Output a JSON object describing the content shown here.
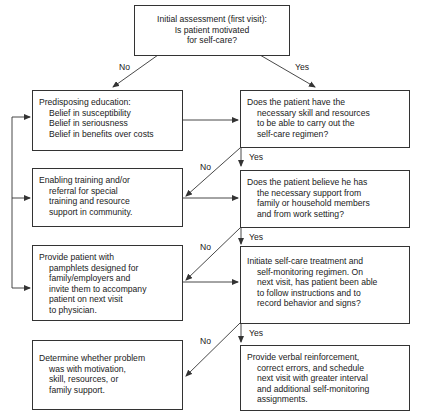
{
  "nodes": {
    "start": {
      "lines": [
        "Initial assessment (first visit):",
        "Is patient motivated",
        "for self-care?"
      ]
    },
    "predisposing": {
      "lines": [
        "Predisposing education:",
        "Belief in susceptibility",
        "Belief in seriousness",
        "Belief in benefits over costs"
      ]
    },
    "enabling": {
      "lines": [
        "Enabling training and/or",
        "referral for special",
        "training and resource",
        "support in community."
      ]
    },
    "pamphlets": {
      "lines": [
        "Provide patient with",
        "pamphlets designed for",
        "family/employers and",
        "invite them to accompany",
        "patient on next visit",
        "to physician."
      ]
    },
    "determine": {
      "lines": [
        "Determine whether problem",
        "was with motivation,",
        "skill, resources, or",
        "family support."
      ]
    },
    "skill_question": {
      "lines": [
        "Does the patient have the",
        "necessary skill and resources",
        "to be able to carry out the",
        "self-care regimen?"
      ]
    },
    "support_question": {
      "lines": [
        "Does the patient believe he has",
        "the necessary support from",
        "family or household members",
        "and from work setting?"
      ]
    },
    "initiate": {
      "lines": [
        "Initiate self-care treatment and",
        "self-monitoring regimen. On",
        "next visit, has patient been able",
        "to follow instructions and to",
        "record behavior and signs?"
      ]
    },
    "reinforce": {
      "lines": [
        "Provide verbal reinforcement,",
        "correct errors, and schedule",
        "next visit with greater interval",
        "and additional self-monitoring",
        "assignments."
      ]
    }
  },
  "edge_labels": {
    "start_no": "No",
    "start_yes": "Yes",
    "skill_no": "No",
    "skill_yes": "Yes",
    "support_no": "No",
    "support_yes": "Yes",
    "initiate_no": "No",
    "initiate_yes": "Yes"
  },
  "colors": {
    "line": "#333333",
    "background": "#ffffff",
    "text": "#1a1a1a"
  }
}
